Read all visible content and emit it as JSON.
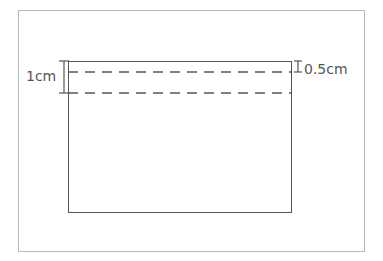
{
  "diagram": {
    "type": "fold-line sketch",
    "labels": {
      "left_measure": "1cm",
      "right_measure": "0.5cm"
    },
    "shapes": {
      "outer_frame": {
        "x": 18,
        "y": 10,
        "w": 347,
        "h": 242
      },
      "rectangle": {
        "x": 68,
        "y": 61,
        "w": 224,
        "h": 152
      },
      "dashed_lines_y": [
        72,
        93
      ]
    },
    "colors": {
      "line": "#555555",
      "frame": "#b8b8b8",
      "background": "#ffffff"
    }
  }
}
